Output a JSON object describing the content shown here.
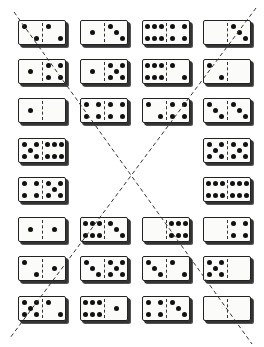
{
  "puzzle": {
    "description": "Domino set arranged in 8 rows with two dashed diagonal lines forming an X",
    "line_color": "#333333",
    "pip_color": "#111111",
    "tile_color": "#fbfbfa",
    "rows": [
      [
        [
          2,
          2
        ],
        [
          1,
          3
        ],
        [
          6,
          4
        ],
        [
          0,
          3
        ]
      ],
      [
        [
          1,
          4
        ],
        [
          1,
          5
        ],
        [
          6,
          2
        ],
        [
          2,
          0
        ]
      ],
      [
        [
          1,
          0
        ],
        [
          4,
          4
        ],
        [
          2,
          4
        ],
        [
          3,
          3
        ]
      ],
      [
        [
          5,
          6
        ],
        null,
        null,
        [
          5,
          5
        ]
      ],
      [
        [
          4,
          5
        ],
        null,
        null,
        [
          6,
          6
        ]
      ],
      [
        [
          1,
          1
        ],
        [
          6,
          3
        ],
        [
          0,
          6
        ],
        [
          0,
          4
        ]
      ],
      [
        [
          2,
          1
        ],
        [
          3,
          5
        ],
        [
          3,
          2
        ],
        [
          5,
          0
        ]
      ],
      [
        [
          5,
          2
        ],
        [
          6,
          1
        ],
        [
          4,
          3
        ],
        [
          0,
          0
        ]
      ]
    ],
    "diagonals": [
      {
        "x1": 14,
        "y1": 12,
        "x2": 252,
        "y2": 344
      },
      {
        "x1": 256,
        "y1": 8,
        "x2": 10,
        "y2": 338
      }
    ]
  }
}
